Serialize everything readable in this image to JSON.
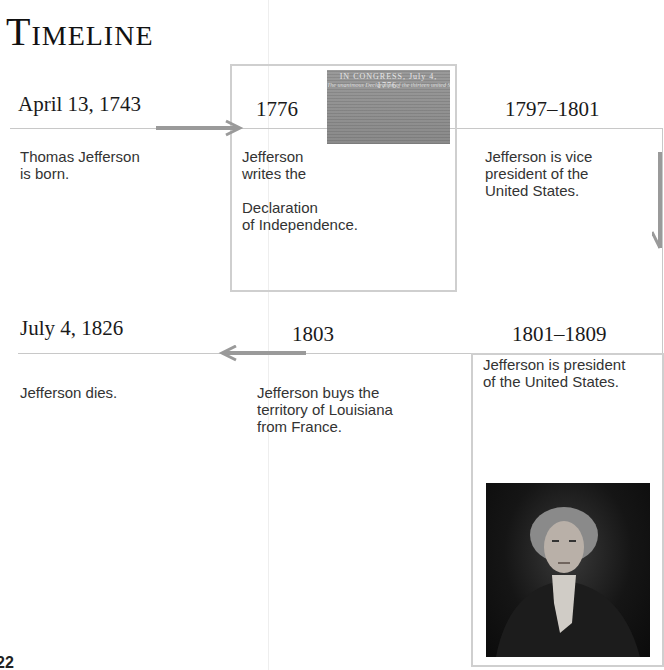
{
  "page": {
    "title": "Timeline",
    "page_number": "22"
  },
  "events": [
    {
      "date": "April 13, 1743",
      "description": "Thomas Jefferson\nis born."
    },
    {
      "date": "1776",
      "description": "Jefferson\nwrites the\n\nDeclaration\nof Independence.",
      "image": "declaration-of-independence-document",
      "image_heading": "IN CONGRESS, July 4, 1776.",
      "image_subheading": "The unanimous Declaration of the thirteen united States of America"
    },
    {
      "date": "1797–1801",
      "description": "Jefferson is vice\npresident of the\nUnited States."
    },
    {
      "date": "1801–1809",
      "description": "Jefferson is president\nof the United States.",
      "image": "thomas-jefferson-portrait"
    },
    {
      "date": "1803",
      "description": "Jefferson buys the\nterritory of Louisiana\nfrom France."
    },
    {
      "date": "July 4, 1826",
      "description": "Jefferson dies."
    }
  ],
  "colors": {
    "arrow": "#9a9a9a",
    "line": "#c8c8c8",
    "box_border": "#cfcfcf"
  }
}
